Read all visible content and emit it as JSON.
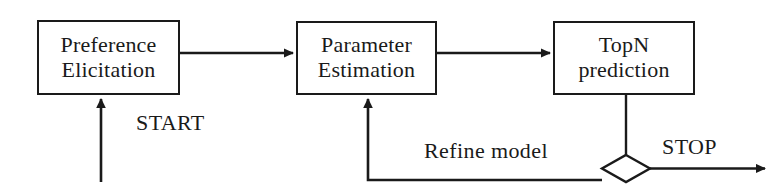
{
  "diagram": {
    "background_color": "#ffffff",
    "stroke_color": "#1a1a1a",
    "nodes": [
      {
        "id": "preference-elicitation",
        "shape": "rectangle",
        "line1": "Preference",
        "line2": "Elicitation"
      },
      {
        "id": "parameter-estimation",
        "shape": "rectangle",
        "line1": "Parameter",
        "line2": "Estimation"
      },
      {
        "id": "topn-prediction",
        "shape": "rectangle",
        "line1": "TopN",
        "line2": "prediction"
      },
      {
        "id": "decision",
        "shape": "diamond",
        "line1": "",
        "line2": ""
      }
    ],
    "edge_labels": {
      "start": "START",
      "refine_model": "Refine model",
      "stop": "STOP"
    }
  }
}
